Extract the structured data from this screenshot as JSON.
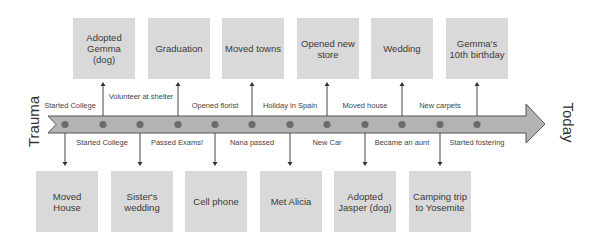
{
  "diagram": {
    "start_label": "Trauma",
    "end_label": "Today",
    "colors": {
      "arrow_fill": "#b3b3b3",
      "arrow_stroke": "#555555",
      "dot": "#6b6b6b",
      "box_fill": "#d9d9d9",
      "connector": "#333333"
    },
    "top_boxes": [
      {
        "label": "Adopted Gemma (dog)"
      },
      {
        "label": "Graduation"
      },
      {
        "label": "Moved towns"
      },
      {
        "label": "Opened new store"
      },
      {
        "label": "Wedding"
      },
      {
        "label": "Gemma's 10th birthday"
      }
    ],
    "bottom_boxes": [
      {
        "label": "Moved House"
      },
      {
        "label": "Sister's wedding"
      },
      {
        "label": "Cell phone"
      },
      {
        "label": "Met Alicia"
      },
      {
        "label": "Adopted Jasper (dog)"
      },
      {
        "label": "Camping trip to Yosemite"
      }
    ],
    "above_labels": [
      {
        "label": "Started College"
      },
      {
        "label": "Volunteer at shelter"
      },
      {
        "label": "Opened florist"
      },
      {
        "label": "Holiday in Spain"
      },
      {
        "label": "Moved house"
      },
      {
        "label": "New carpets"
      }
    ],
    "below_labels": [
      {
        "label": "Started College"
      },
      {
        "label": "Passed Exams!"
      },
      {
        "label": "Nana passed"
      },
      {
        "label": "New Car"
      },
      {
        "label": "Became an aunt"
      },
      {
        "label": "Started fostering"
      }
    ],
    "dot_count": 12
  }
}
